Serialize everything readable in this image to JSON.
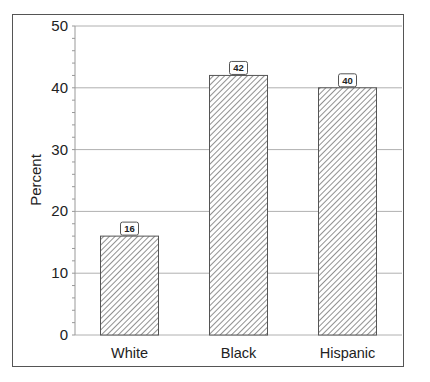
{
  "chart_data": {
    "type": "bar",
    "title": "",
    "xlabel": "",
    "ylabel": "Percent",
    "categories": [
      "White",
      "Black",
      "Hispanic"
    ],
    "values": [
      16,
      42,
      40
    ],
    "data_labels": [
      "16",
      "42",
      "40"
    ],
    "ylim": [
      0,
      50
    ],
    "yticks": [
      0,
      10,
      20,
      30,
      40,
      50
    ],
    "ytick_labels": [
      "0",
      "10",
      "20",
      "30",
      "40",
      "50"
    ],
    "minor_ticks_per_major": 5,
    "grid": true,
    "legend": null,
    "bar_fill": "diagonal-hatch",
    "colors": {
      "hatch": "#555555",
      "grid": "#b0b0b0",
      "frame": "#555555",
      "text": "#222222"
    }
  }
}
